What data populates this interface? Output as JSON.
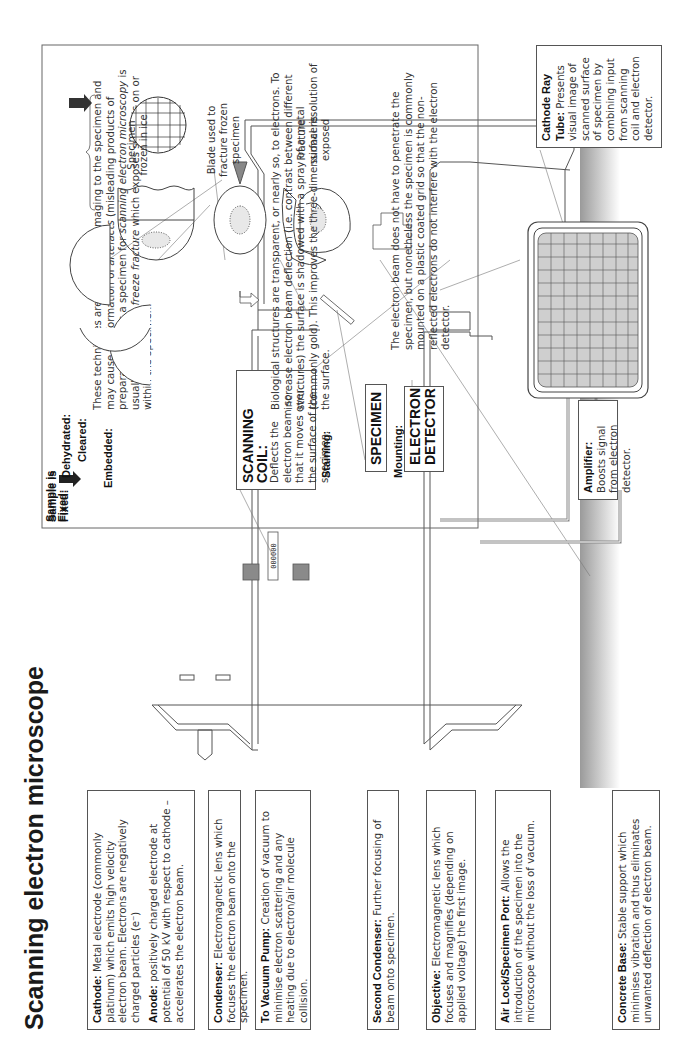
{
  "title": "Scanning electron microscope",
  "labels": {
    "cathode": {
      "term": "Cathode:",
      "text": " Metal electrode (commonly platinum) which emits high velocity electron beam. Electrons are negatively charged particles (e⁻)"
    },
    "anode": {
      "term": "Anode:",
      "text": " positively charged electrode at potential of 50 kV with respect to cathode – accelerates the electron beam."
    },
    "condenser": {
      "term": "Condenser:",
      "text": " Electromagnetic lens which focuses the electron beam onto the specimen."
    },
    "vacuum_pump": {
      "term": "To Vacuum Pump:",
      "text": " Creation of vacuum to minimise electron scattering and any heating due to electron/air molecule collision."
    },
    "second_condenser": {
      "term": "Second Condenser:",
      "text": " Further focusing of beam onto specimen."
    },
    "objective": {
      "term": "Objective:",
      "text": " Electromagnetic lens which focuses and magnifies (depending on applied voltage) the first image."
    },
    "air_lock": {
      "term": "Air Lock/Specimen Port:",
      "text": " Allows the introduction of the specimen into the microscope without the loss of vacuum."
    },
    "concrete_base": {
      "term": "Concrete Base:",
      "text": " Stable support which minimises vibration and thus eliminates unwanted deflection of electron beam."
    },
    "scanning_coil": {
      "term": "SCANNING COIL:",
      "text": "Deflects the electron beam so that it moves over the surface of the specimen."
    },
    "specimen": {
      "term": "SPECIMEN"
    },
    "electron_detector": {
      "term": "ELECTRON DETECTOR"
    },
    "amplifier": {
      "term": "Amplifier:",
      "text": " Boosts signal from electron detector."
    },
    "crt": {
      "term": "Cathode Ray Tube:",
      "text": " Presents visual image of scanned surface of specimen by combining input from scanning coil and electron detector."
    }
  },
  "preparation": {
    "steps": [
      {
        "label": "Sample is Fixed:"
      },
      {
        "label": "Dehydrated:"
      },
      {
        "label": "Cleared:"
      },
      {
        "label": "Embedded:"
      },
      {
        "label": "Staining:"
      },
      {
        "label": "Mounting:"
      }
    ],
    "intro": {
      "t1": "These techniques are potentially damaging to the specimen and may cause the formation of ",
      "i1": "artefacts",
      "t2": " (misleading products of preparation). Thus a specimen for ",
      "i2": "scanning electron microscopy",
      "t3": " is usually prepared by ",
      "i3": "freeze fracture",
      "t4": " which exposes surfaces on or within the specimen."
    },
    "captions": [
      "Specimen frozen in ice",
      "Blade used to fracture frozen specimen",
      "Fracture surface is exposed"
    ],
    "staining_text": "Biological structures are transparent, or nearly so, to electrons. To increase electron beam deflection (i.e. contrast between different structures) the surface is shadowed with a spray of a metal (commonly gold). This improves the three-dimensional resolution of the surface.",
    "mounting_text": "The electron beam does not have to penetrate the specimen, but nonetheless the specimen is commonly mounted on a plastic coated grid so that the non-reflected electrons do not interfere with the electron detector."
  },
  "colors": {
    "lens": "#8a8a8a",
    "screen": "#d0d0d0",
    "base": "#9a9a9a",
    "outline": "#555555",
    "cable": "#888888"
  }
}
